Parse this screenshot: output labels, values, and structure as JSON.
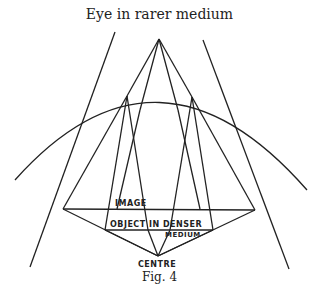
{
  "title": "Eye in rarer medium",
  "caption": "Fig. 4",
  "labels": {
    "image": "IMAGE",
    "object": "OBJECT IN DENSER",
    "medium": "MEDIUM",
    "centre": "CENTRE"
  }
}
